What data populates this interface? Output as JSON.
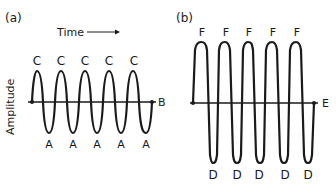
{
  "panel_a": {
    "label": "(a)",
    "time_label": "Time",
    "amplitude_label": "Amplitude",
    "peak_labels": [
      "C",
      "C",
      "C",
      "C",
      "C"
    ],
    "trough_labels": [
      "A",
      "A",
      "A",
      "A",
      "A"
    ],
    "baseline_label": "B"
  },
  "panel_b": {
    "label": "(b)",
    "peak_labels": [
      "F",
      "F",
      "F",
      "F",
      "F"
    ],
    "trough_labels": [
      "D",
      "D",
      "D",
      "D",
      "D"
    ],
    "baseline_label": "E"
  },
  "colors": {
    "stroke": "#1a1a1a",
    "background": "#ffffff"
  }
}
